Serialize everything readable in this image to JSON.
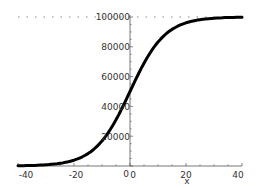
{
  "chart_data": {
    "type": "line",
    "title": "",
    "xlabel": "x",
    "ylabel": "",
    "xlim": [
      -40,
      40
    ],
    "ylim": [
      0,
      100000
    ],
    "x_ticks": [
      "-40",
      "-20",
      "0",
      "20",
      "40"
    ],
    "y_ticks": [
      "20000",
      "40000",
      "60000",
      "80000",
      "100000"
    ],
    "origin_label": "0",
    "asymptote": {
      "value": 100000,
      "style": "dotted"
    },
    "grid": false,
    "legend": null,
    "series": [
      {
        "name": "logistic",
        "x": [
          -40,
          -35,
          -30,
          -25,
          -20,
          -15,
          -10,
          -5,
          0,
          5,
          10,
          15,
          20,
          25,
          30,
          35,
          40
        ],
        "values": [
          165,
          369,
          816,
          1799,
          3920,
          8317,
          16798,
          31003,
          50000,
          68997,
          83202,
          91683,
          96080,
          98201,
          99184,
          99631,
          99835
        ]
      }
    ]
  },
  "colors": {
    "curve": "#000000",
    "axis": "#555555",
    "asymptote": "#888888",
    "text": "#333333"
  }
}
